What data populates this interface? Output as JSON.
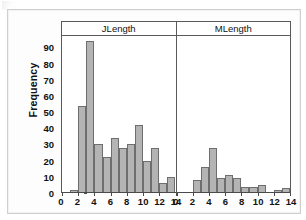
{
  "figure": {
    "ylabel": "Frequency",
    "y_ticks": [
      0,
      10,
      20,
      30,
      40,
      50,
      60,
      70,
      80,
      90
    ],
    "x_ticks": [
      0,
      2,
      4,
      6,
      8,
      10,
      12,
      14
    ],
    "panel_titles": [
      "JLength",
      "MLength"
    ],
    "bar_fill": "#b4b4b4",
    "bar_edge": "#6e6e6e",
    "axis_color": "#4a4a4a",
    "frame_color": "#5a5a5a",
    "background": "#ffffff"
  },
  "chart_data": {
    "type": "bar",
    "title": "",
    "subtitle": "",
    "xlabel": "",
    "ylabel": "Frequency",
    "ylim": [
      0,
      97
    ],
    "xlim": [
      0,
      14
    ],
    "grid": false,
    "legend_position": "none",
    "layout": "two-panel histogram, bin width 1",
    "panels": [
      {
        "name": "JLength",
        "bin_width": 1,
        "bin_starts": [
          1,
          2,
          3,
          4,
          5,
          6,
          7,
          8,
          9,
          10,
          11,
          12,
          13
        ],
        "categories": [
          "1-2",
          "2-3",
          "3-4",
          "4-5",
          "5-6",
          "6-7",
          "7-8",
          "8-9",
          "9-10",
          "10-11",
          "11-12",
          "12-13",
          "13-14"
        ],
        "values": [
          2,
          54,
          94,
          30,
          22,
          34,
          28,
          30,
          42,
          20,
          28,
          6,
          10
        ],
        "xticks": [
          0,
          2,
          4,
          6,
          8,
          10,
          12,
          14
        ]
      },
      {
        "name": "MLength",
        "bin_width": 1,
        "bin_starts": [
          2,
          3,
          4,
          5,
          6,
          7,
          8,
          9,
          10,
          12,
          13
        ],
        "categories": [
          "2-3",
          "3-4",
          "4-5",
          "5-6",
          "6-7",
          "7-8",
          "8-9",
          "9-10",
          "10-11",
          "12-13",
          "13-14"
        ],
        "values": [
          8,
          16,
          28,
          9,
          11,
          9,
          4,
          4,
          5,
          2,
          3
        ],
        "xticks": [
          0,
          2,
          4,
          6,
          8,
          10,
          12,
          14
        ]
      }
    ]
  }
}
